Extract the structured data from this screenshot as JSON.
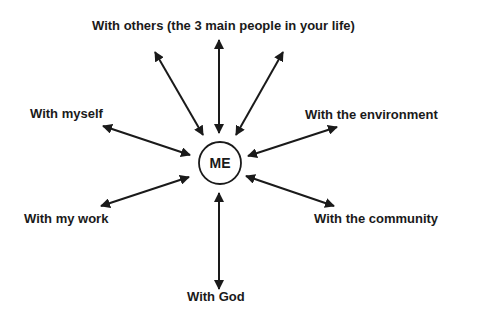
{
  "diagram": {
    "center": {
      "label": "ME",
      "cx": 220,
      "cy": 163,
      "r": 21
    },
    "nodes": [
      {
        "id": "others",
        "label": "With others (the 3 main people in your life)"
      },
      {
        "id": "myself",
        "label": "With myself"
      },
      {
        "id": "environment",
        "label": "With the environment"
      },
      {
        "id": "work",
        "label": "With my work"
      },
      {
        "id": "community",
        "label": "With the community"
      },
      {
        "id": "god",
        "label": "With God"
      }
    ],
    "arrows": [
      {
        "to": "others",
        "x1": 155,
        "y1": 52,
        "x2": 203,
        "y2": 135
      },
      {
        "to": "others",
        "x1": 219,
        "y1": 40,
        "x2": 219,
        "y2": 133
      },
      {
        "to": "others",
        "x1": 283,
        "y1": 52,
        "x2": 236,
        "y2": 135
      },
      {
        "to": "myself",
        "x1": 103,
        "y1": 126,
        "x2": 190,
        "y2": 155
      },
      {
        "to": "environment",
        "x1": 337,
        "y1": 127,
        "x2": 248,
        "y2": 156
      },
      {
        "to": "work",
        "x1": 101,
        "y1": 206,
        "x2": 189,
        "y2": 177
      },
      {
        "to": "community",
        "x1": 334,
        "y1": 206,
        "x2": 246,
        "y2": 176
      },
      {
        "to": "god",
        "x1": 219,
        "y1": 193,
        "x2": 219,
        "y2": 289
      }
    ],
    "colors": {
      "ink": "#1a1a1a",
      "background": "#ffffff"
    }
  }
}
